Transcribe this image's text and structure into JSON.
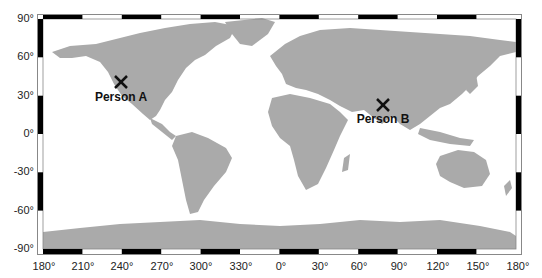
{
  "map": {
    "projection": "equirectangular",
    "land_color": "#aaaaaa",
    "ocean_color": "#ffffff",
    "frame_colors": [
      "#000000",
      "#ffffff"
    ],
    "marker_color": "#111111",
    "lat_labels": [
      "90°",
      "60°",
      "30°",
      "0°",
      "-30°",
      "-60°",
      "-90°"
    ],
    "lon_labels": [
      "180°",
      "210°",
      "240°",
      "270°",
      "300°",
      "330°",
      "0°",
      "30°",
      "60°",
      "90°",
      "120°",
      "150°",
      "180°"
    ],
    "markers": [
      {
        "label": "Person A",
        "lon": 240,
        "lat": 40
      },
      {
        "label": "Person B",
        "lon": 78,
        "lat": 22
      }
    ]
  }
}
